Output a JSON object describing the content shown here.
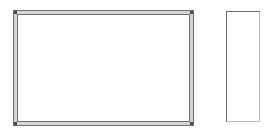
{
  "canvas": {
    "width": 275,
    "height": 137,
    "background_color": "#ffffff",
    "description": "Line drawing of two empty rectangles"
  },
  "shapes": [
    {
      "id": "large-framed-rectangle",
      "label": "Large framed rectangle",
      "kind": "rectangle",
      "orientation": "landscape",
      "border_style": "double-line frame",
      "x": 13,
      "y": 10,
      "width": 181,
      "height": 116,
      "fill_color": "#ffffff",
      "outer_line_color": "#6e6e6e",
      "inner_line_color": "#717171",
      "frame_fill_color": "#d4d4d4",
      "corner_mark_color": "#4a4a4a",
      "frame_thickness": 3
    },
    {
      "id": "small-plain-rectangle",
      "label": "Small plain rectangle",
      "kind": "rectangle",
      "orientation": "portrait",
      "border_style": "single-line",
      "x": 226,
      "y": 11,
      "width": 34,
      "height": 111,
      "fill_color": "#ffffff",
      "line_color": "#6b6b6b",
      "shadow_line_color": "#bdbdbd"
    }
  ]
}
